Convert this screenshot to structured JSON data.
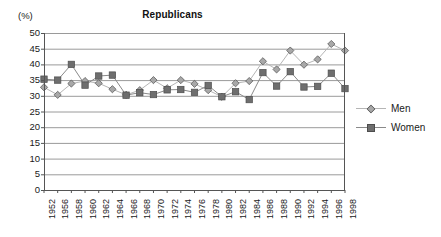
{
  "chart_data": {
    "type": "line",
    "title": "Republicans",
    "xlabel": "",
    "ylabel": "(%)",
    "ylim": [
      0,
      50
    ],
    "ytick_step": 5,
    "yticks": [
      50,
      45,
      40,
      35,
      30,
      25,
      20,
      15,
      10,
      5,
      0
    ],
    "grid": true,
    "legend_position": "right",
    "categories": [
      "1952",
      "1956",
      "1958",
      "1960",
      "1962",
      "1964",
      "1966",
      "1968",
      "1970",
      "1972",
      "1974",
      "1976",
      "1978",
      "1980",
      "1982",
      "1984",
      "1986",
      "1988",
      "1990",
      "1992",
      "1994",
      "1996",
      "1998"
    ],
    "series": [
      {
        "name": "Men",
        "marker": "diamond",
        "color": "#a8a8a8",
        "line_color": "#b5b5b5",
        "values": [
          32.7,
          30.3,
          33.9,
          34.7,
          34.0,
          32.1,
          30.3,
          31.8,
          35.0,
          32.4,
          35.0,
          33.8,
          31.8,
          29.7,
          34.0,
          34.7,
          41.0,
          38.4,
          44.4,
          39.9,
          41.6,
          46.5,
          44.4
        ]
      },
      {
        "name": "Women",
        "marker": "square",
        "color": "#6e6e6e",
        "line_color": "#8a8a8a",
        "values": [
          35.3,
          35.0,
          40.0,
          33.4,
          36.3,
          36.6,
          30.2,
          31.0,
          30.4,
          31.9,
          32.0,
          31.1,
          33.3,
          29.7,
          31.3,
          28.8,
          37.4,
          33.1,
          37.7,
          32.8,
          33.0,
          37.2,
          32.3
        ]
      }
    ]
  },
  "legend": {
    "entries": [
      {
        "label": "Men"
      },
      {
        "label": "Women"
      }
    ]
  },
  "colors": {
    "men": "#a8a8a8",
    "women": "#6e6e6e",
    "grid": "#9a9a9a",
    "axis": "#555555",
    "text": "#1a1a1a"
  }
}
